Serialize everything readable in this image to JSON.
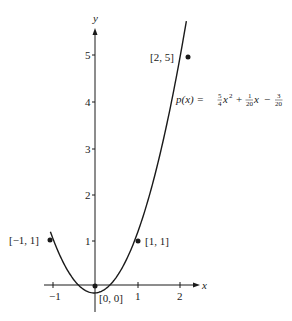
{
  "chart_data": {
    "type": "scatter",
    "title": "",
    "xlabel": "x",
    "ylabel": "y",
    "xlim": [
      -1.1,
      2.3
    ],
    "ylim": [
      0,
      5.6
    ],
    "grid": false,
    "x_ticks": [
      "-1",
      "1",
      "2"
    ],
    "y_ticks": [
      "1",
      "2",
      "3",
      "4",
      "5"
    ],
    "series": [
      {
        "name": "data points",
        "kind": "scatter",
        "points": [
          {
            "x": -1,
            "y": 1,
            "label": "[−1, 1]"
          },
          {
            "x": 0,
            "y": 0,
            "label": "[0, 0]"
          },
          {
            "x": 1,
            "y": 1,
            "label": "[1, 1]"
          },
          {
            "x": 2,
            "y": 5,
            "label": "[2, 5]"
          }
        ]
      },
      {
        "name": "p(x)",
        "kind": "line",
        "formula": "p(x) = (5/4)x^2 + (1/20)x - 3/20",
        "coefficients": {
          "a": 1.25,
          "b": 0.05,
          "c": -0.15
        },
        "x_range": [
          -1.05,
          2.15
        ]
      }
    ],
    "annotations": [
      {
        "text": "p(x) = 5/4 x² + 1/20 x − 3/20",
        "near": "curve, right of y=4"
      }
    ]
  },
  "axis": {
    "x_label": "x",
    "y_label": "y",
    "x_tick_labels": [
      "−1",
      "1",
      "2"
    ],
    "y_tick_labels": [
      "1",
      "2",
      "3",
      "4",
      "5"
    ]
  },
  "labels": {
    "p0": "[−1, 1]",
    "p1": "[0, 0]",
    "p2": "[1, 1]",
    "p3": "[2, 5]"
  },
  "formula": {
    "lhs": "p(x) = ",
    "a_num": "5",
    "a_den": "4",
    "x2": "x",
    "sup": "2",
    "plus": "+",
    "b_num": "1",
    "b_den": "20",
    "x1": "x",
    "minus": "−",
    "c_num": "3",
    "c_den": "20"
  },
  "colors": {
    "ink": "#1a1a1a",
    "background": "#ffffff"
  }
}
